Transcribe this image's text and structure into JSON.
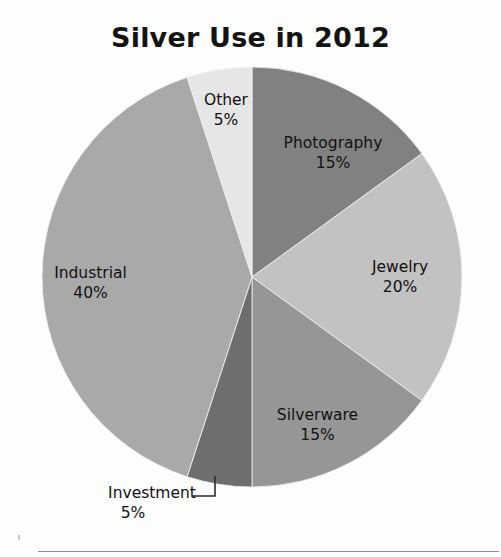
{
  "chart_data": {
    "type": "pie",
    "title": "Silver Use in 2012",
    "xlabel": "",
    "ylabel": "",
    "legend_position": "none",
    "grid": false,
    "units": "percent",
    "start_angle_deg": 0,
    "direction": "clockwise",
    "categories": [
      "Photography",
      "Jewelry",
      "Silverware",
      "Investment",
      "Industrial",
      "Other"
    ],
    "values": [
      15,
      20,
      15,
      5,
      40,
      5
    ],
    "slices": [
      {
        "name": "Photography",
        "value": 15,
        "label": "Photography",
        "value_label": "15%",
        "color": "#818181",
        "start_deg": 0,
        "end_deg": 54,
        "label_placement": "inside"
      },
      {
        "name": "Jewelry",
        "value": 20,
        "label": "Jewelry",
        "value_label": "20%",
        "color": "#c2c2c2",
        "start_deg": 54,
        "end_deg": 126,
        "label_placement": "inside"
      },
      {
        "name": "Silverware",
        "value": 15,
        "label": "Silverware",
        "value_label": "15%",
        "color": "#969696",
        "start_deg": 126,
        "end_deg": 180,
        "label_placement": "inside"
      },
      {
        "name": "Investment",
        "value": 5,
        "label": "Investment",
        "value_label": "5%",
        "color": "#6e6e6e",
        "start_deg": 180,
        "end_deg": 198,
        "label_placement": "outside-leader"
      },
      {
        "name": "Industrial",
        "value": 40,
        "label": "Industrial",
        "value_label": "40%",
        "color": "#a9a9a9",
        "start_deg": 198,
        "end_deg": 342,
        "label_placement": "inside"
      },
      {
        "name": "Other",
        "value": 5,
        "label": "Other",
        "value_label": "5%",
        "color": "#e6e6e6",
        "start_deg": 342,
        "end_deg": 360,
        "label_placement": "inside"
      }
    ]
  },
  "title": "Silver Use in 2012"
}
